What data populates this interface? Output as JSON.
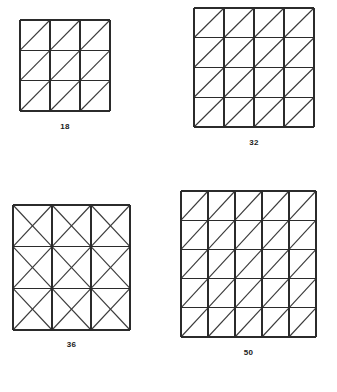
{
  "page": {
    "background_color": "#ffffff",
    "line_color": "#2b2b2b",
    "label_color": "#1a1a1a"
  },
  "figures": [
    {
      "id": "fig-0",
      "label": "18",
      "rows": 3,
      "cols": 3,
      "diagonal_style": "forward",
      "description": "3 by 3 square grid with one diagonal from bottom-left to top-right in every cell"
    },
    {
      "id": "fig-1",
      "label": "32",
      "rows": 4,
      "cols": 4,
      "diagonal_style": "forward",
      "description": "4 by 4 square grid with one diagonal from bottom-left to top-right in every cell"
    },
    {
      "id": "fig-2",
      "label": "36",
      "rows": 3,
      "cols": 3,
      "diagonal_style": "cross",
      "description": "3 by 3 square grid with both diagonals forming an X in every cell"
    },
    {
      "id": "fig-3",
      "label": "50",
      "rows": 5,
      "cols": 5,
      "diagonal_style": "forward",
      "description": "5 by 5 square grid with one diagonal from bottom-left to top-right in every cell"
    }
  ]
}
